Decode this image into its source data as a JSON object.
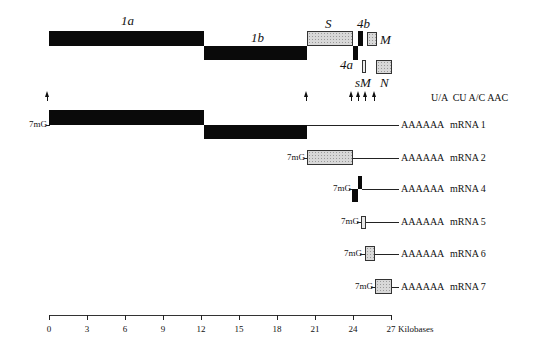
{
  "genome": {
    "orfs": [
      {
        "name": "1a",
        "start_kb": 0,
        "end_kb": 12.3,
        "fill": "black"
      },
      {
        "name": "1b",
        "start_kb": 12.3,
        "end_kb": 20.4,
        "fill": "black"
      },
      {
        "name": "S",
        "start_kb": 20.4,
        "end_kb": 24.0,
        "fill": "stippled"
      },
      {
        "name": "4a",
        "start_kb": 24.0,
        "end_kb": 24.4,
        "fill": "black"
      },
      {
        "name": "4b",
        "start_kb": 24.4,
        "end_kb": 24.8,
        "fill": "black"
      },
      {
        "name": "sM",
        "start_kb": 24.9,
        "end_kb": 25.2,
        "fill": "open"
      },
      {
        "name": "M",
        "start_kb": 25.3,
        "end_kb": 26.1,
        "fill": "stippled"
      },
      {
        "name": "N",
        "start_kb": 25.7,
        "end_kb": 26.9,
        "fill": "stippled"
      }
    ],
    "labels": {
      "1a": "1a",
      "1b": "1b",
      "S": "S",
      "4a": "4a",
      "4b": "4b",
      "M": "M",
      "sM": "sM",
      "N": "N"
    },
    "tas_label": "U/A  CU A/C AAC",
    "tas_arrows_kb": [
      0,
      20.4,
      24.0,
      24.5,
      25.0,
      25.7
    ]
  },
  "mrnas": [
    {
      "name": "mRNA 1",
      "cap": "7mG",
      "tail": "AAAAAA"
    },
    {
      "name": "mRNA 2",
      "cap": "7mG",
      "tail": "AAAAAA"
    },
    {
      "name": "mRNA 4",
      "cap": "7mG",
      "tail": "AAAAAA"
    },
    {
      "name": "mRNA 5",
      "cap": "7mG",
      "tail": "AAAAAA"
    },
    {
      "name": "mRNA 6",
      "cap": "7mG",
      "tail": "AAAAAA"
    },
    {
      "name": "mRNA 7",
      "cap": "7mG",
      "tail": "AAAAAA"
    }
  ],
  "axis": {
    "ticks": [
      "0",
      "3",
      "6",
      "9",
      "12",
      "15",
      "18",
      "21",
      "24",
      "27"
    ],
    "unit": "Kilobases",
    "range_kb": [
      0,
      27
    ]
  }
}
